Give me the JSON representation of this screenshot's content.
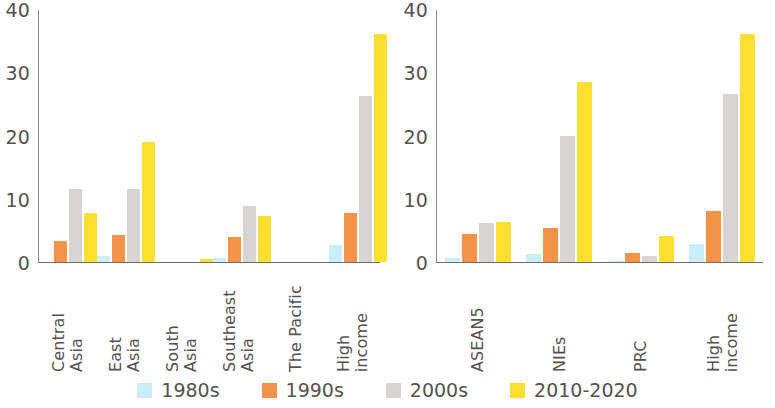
{
  "chart_data": [
    {
      "panel": "left",
      "type": "bar",
      "title": "",
      "xlabel": "",
      "ylabel": "",
      "ylim": [
        0,
        40
      ],
      "yticks": [
        0,
        10,
        20,
        30,
        40
      ],
      "ytick_labels": [
        "0",
        "10",
        "20",
        "30",
        "40"
      ],
      "grid": false,
      "legend_position": "bottom",
      "categories": [
        "Central Asia",
        "East Asia",
        "South Asia",
        "Southeast Asia",
        "The Pacific",
        "High income"
      ],
      "category_lines": [
        [
          "Central",
          "Asia"
        ],
        [
          "East",
          "Asia"
        ],
        [
          "South",
          "Asia"
        ],
        [
          "Southeast",
          "Asia"
        ],
        [
          "The Pacific"
        ],
        [
          "High",
          "income"
        ]
      ],
      "series": [
        {
          "name": "1980s",
          "color": "#c9eef7",
          "values": [
            0,
            0.9,
            0,
            0.7,
            0,
            2.7
          ]
        },
        {
          "name": "1990s",
          "color": "#f59348",
          "values": [
            3.3,
            4.3,
            0,
            3.9,
            0,
            7.7
          ]
        },
        {
          "name": "2000s",
          "color": "#d8d4d2",
          "values": [
            11.5,
            11.6,
            0,
            8.8,
            0,
            26.2
          ]
        },
        {
          "name": "2010-2020",
          "color": "#fbe032",
          "values": [
            7.7,
            19.0,
            0.5,
            7.3,
            0,
            36.0
          ]
        }
      ]
    },
    {
      "panel": "right",
      "type": "bar",
      "title": "",
      "xlabel": "",
      "ylabel": "",
      "ylim": [
        0,
        40
      ],
      "yticks": [
        0,
        10,
        20,
        30,
        40
      ],
      "ytick_labels": [
        "0",
        "10",
        "20",
        "30",
        "40"
      ],
      "grid": false,
      "legend_position": "bottom",
      "categories": [
        "ASEAN5",
        "NIEs",
        "PRC",
        "High income"
      ],
      "category_lines": [
        [
          "ASEAN5"
        ],
        [
          "NIEs"
        ],
        [
          "PRC"
        ],
        [
          "High",
          "income"
        ]
      ],
      "series": [
        {
          "name": "1980s",
          "color": "#c9eef7",
          "values": [
            0.6,
            1.3,
            0.2,
            2.8
          ]
        },
        {
          "name": "1990s",
          "color": "#f59348",
          "values": [
            4.4,
            5.4,
            1.4,
            8.0
          ]
        },
        {
          "name": "2000s",
          "color": "#d8d4d2",
          "values": [
            6.2,
            20.0,
            0.9,
            26.5
          ]
        },
        {
          "name": "2010-2020",
          "color": "#fbe032",
          "values": [
            6.4,
            28.5,
            4.1,
            36.0
          ]
        }
      ]
    }
  ],
  "legend": {
    "items": [
      {
        "label": "1980s",
        "color": "#c9eef7"
      },
      {
        "label": "1990s",
        "color": "#f59348"
      },
      {
        "label": "2000s",
        "color": "#d8d4d2"
      },
      {
        "label": "2010-2020",
        "color": "#fbe032"
      }
    ]
  }
}
